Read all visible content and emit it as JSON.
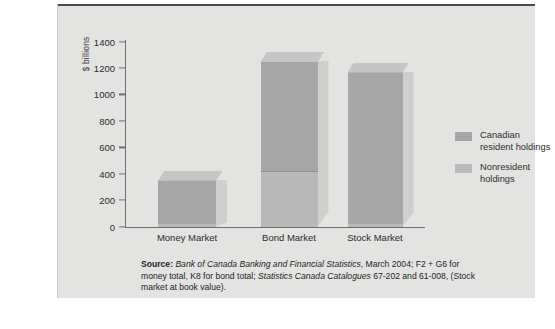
{
  "figure": {
    "y_axis_label": "$ billions",
    "legend": [
      {
        "label_line1": "Canadian",
        "label_line2": "resident holdings",
        "color": "#a6a6a6",
        "name": "Canadian resident holdings"
      },
      {
        "label_line1": "Nonresident",
        "label_line2": "holdings",
        "color": "#b9b9b9",
        "name": "Nonresident holdings"
      }
    ],
    "source_note": {
      "label": "Source:",
      "italic1": "Bank of Canada Banking and Financial Statistics",
      "text1": ", March 2004;",
      "text2": "F2 + G6 for money total, K8 for bond total; ",
      "italic2": "Statistics Canada Catalogues",
      "text3": "67-202 and 61-008, (Stock market at book value)."
    }
  },
  "chart_data": {
    "type": "bar",
    "subtype": "stacked-3d-column",
    "title": "",
    "xlabel": "",
    "ylabel": "$ billions",
    "ylim": [
      0,
      1400
    ],
    "yticks": [
      0,
      200,
      400,
      600,
      800,
      1000,
      1200,
      1400
    ],
    "ytick_labels": [
      "0",
      "200",
      "400",
      "600",
      "800",
      "1000",
      "1200",
      "1400"
    ],
    "grid": false,
    "legend_position": "right",
    "categories": [
      "Money Market",
      "Bond Market",
      "Stock Market"
    ],
    "series": [
      {
        "name": "Canadian resident holdings",
        "color": "#a6a6a6",
        "values": [
          330,
          840,
          1150
        ]
      },
      {
        "name": "Nonresident holdings",
        "color": "#b9b9b9",
        "values": [
          20,
          410,
          20
        ]
      }
    ],
    "totals": [
      350,
      1250,
      1170
    ]
  }
}
